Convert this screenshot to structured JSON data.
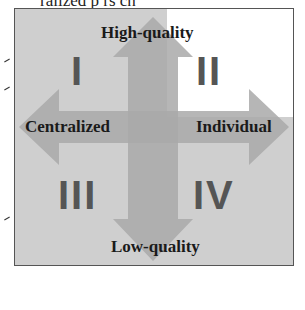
{
  "header_fragment": "ralized p rs ch",
  "axes": {
    "top": "High-quality",
    "bottom": "Low-quality",
    "left": "Centralized",
    "right": "Individual"
  },
  "quadrants": [
    {
      "id": "I",
      "position": "top-left"
    },
    {
      "id": "II",
      "position": "top-right",
      "highlighted": true
    },
    {
      "id": "III",
      "position": "bottom-left"
    },
    {
      "id": "IV",
      "position": "bottom-right"
    }
  ],
  "colors": {
    "background": "#cfcfcf",
    "highlight": "#ffffff",
    "arrow": "#a9a9a9",
    "numeral": "#555555",
    "text": "#1a1a1a"
  }
}
